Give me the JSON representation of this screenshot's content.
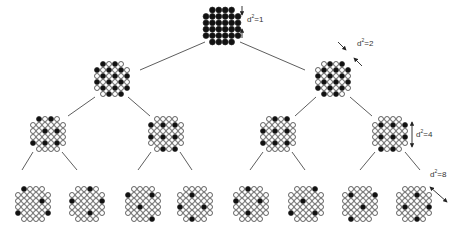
{
  "colors": {
    "filled": "#111111",
    "stroke": "#222222",
    "empty": "#ffffff",
    "line": "#333333"
  },
  "grid_rows": [
    [
      1,
      2,
      3,
      4
    ],
    [
      0,
      1,
      2,
      3,
      4,
      5
    ],
    [
      0,
      1,
      2,
      3,
      4,
      5
    ],
    [
      0,
      1,
      2,
      3,
      4,
      5
    ],
    [
      0,
      1,
      2,
      3,
      4,
      5
    ],
    [
      1,
      2,
      3,
      4
    ]
  ],
  "nodes": [
    {
      "id": "root",
      "cx": 222,
      "cy": 26,
      "pitch": 6.4,
      "r": 2.9,
      "mask": [
        "1111",
        "111111",
        "111111",
        "111111",
        "111111",
        "1111"
      ]
    },
    {
      "id": "L1",
      "cx": 112,
      "cy": 79,
      "pitch": 6.0,
      "r": 2.5,
      "mask": [
        "1010",
        "101010",
        "010101",
        "101010",
        "010101",
        "0101"
      ]
    },
    {
      "id": "R1",
      "cx": 333,
      "cy": 79,
      "pitch": 6.0,
      "r": 2.5,
      "mask": [
        "0101",
        "010101",
        "101010",
        "010101",
        "101010",
        "1010"
      ]
    },
    {
      "id": "LL",
      "cx": 48,
      "cy": 134,
      "pitch": 6.0,
      "r": 2.5,
      "mask": [
        "1010",
        "000000",
        "001010",
        "000000",
        "101010",
        "0000"
      ]
    },
    {
      "id": "LR",
      "cx": 166,
      "cy": 134,
      "pitch": 6.0,
      "r": 2.5,
      "mask": [
        "0000",
        "101010",
        "000000",
        "101010",
        "000000",
        "0101"
      ]
    },
    {
      "id": "RL",
      "cx": 278,
      "cy": 134,
      "pitch": 6.0,
      "r": 2.5,
      "mask": [
        "0101",
        "000000",
        "101010",
        "000000",
        "101010",
        "0000"
      ]
    },
    {
      "id": "RR",
      "cx": 390,
      "cy": 134,
      "pitch": 6.0,
      "r": 2.5,
      "mask": [
        "0000",
        "010101",
        "000000",
        "010101",
        "000000",
        "1010"
      ]
    },
    {
      "id": "LLL",
      "cx": 33,
      "cy": 204,
      "pitch": 6.0,
      "r": 2.5,
      "mask": [
        "1000",
        "000000",
        "000010",
        "000000",
        "100001",
        "0000"
      ]
    },
    {
      "id": "LLR",
      "cx": 87,
      "cy": 204,
      "pitch": 6.0,
      "r": 2.5,
      "mask": [
        "0010",
        "000000",
        "100001",
        "000000",
        "000100",
        "0000"
      ]
    },
    {
      "id": "LRL",
      "cx": 143,
      "cy": 204,
      "pitch": 6.0,
      "r": 2.5,
      "mask": [
        "0000",
        "100010",
        "000000",
        "001000",
        "000000",
        "0001"
      ]
    },
    {
      "id": "LRR",
      "cx": 195,
      "cy": 204,
      "pitch": 6.0,
      "r": 2.5,
      "mask": [
        "0000",
        "001000",
        "000000",
        "100010",
        "000000",
        "0100"
      ]
    },
    {
      "id": "RLL",
      "cx": 251,
      "cy": 204,
      "pitch": 6.0,
      "r": 2.5,
      "mask": [
        "0100",
        "000000",
        "100010",
        "000000",
        "001000",
        "0000"
      ]
    },
    {
      "id": "RLR",
      "cx": 306,
      "cy": 204,
      "pitch": 6.0,
      "r": 2.5,
      "mask": [
        "0001",
        "000000",
        "001000",
        "000000",
        "100010",
        "0000"
      ]
    },
    {
      "id": "RRL",
      "cx": 360,
      "cy": 204,
      "pitch": 6.0,
      "r": 2.5,
      "mask": [
        "0000",
        "010001",
        "000000",
        "000100",
        "000000",
        "1000"
      ]
    },
    {
      "id": "RRR",
      "cx": 414,
      "cy": 204,
      "pitch": 6.0,
      "r": 2.5,
      "mask": [
        "0000",
        "000100",
        "000000",
        "010001",
        "000000",
        "0010"
      ]
    }
  ],
  "edges": [
    {
      "from": [
        205,
        42
      ],
      "to": [
        140,
        70
      ]
    },
    {
      "from": [
        240,
        42
      ],
      "to": [
        305,
        70
      ]
    },
    {
      "from": [
        95,
        97
      ],
      "to": [
        68,
        116
      ]
    },
    {
      "from": [
        128,
        97
      ],
      "to": [
        150,
        116
      ]
    },
    {
      "from": [
        316,
        97
      ],
      "to": [
        295,
        116
      ]
    },
    {
      "from": [
        350,
        97
      ],
      "to": [
        372,
        116
      ]
    },
    {
      "from": [
        33,
        152
      ],
      "to": [
        22,
        170
      ]
    },
    {
      "from": [
        62,
        152
      ],
      "to": [
        77,
        170
      ]
    },
    {
      "from": [
        151,
        152
      ],
      "to": [
        138,
        170
      ]
    },
    {
      "from": [
        180,
        152
      ],
      "to": [
        192,
        170
      ]
    },
    {
      "from": [
        263,
        152
      ],
      "to": [
        250,
        170
      ]
    },
    {
      "from": [
        292,
        152
      ],
      "to": [
        305,
        170
      ]
    },
    {
      "from": [
        375,
        152
      ],
      "to": [
        360,
        170
      ]
    },
    {
      "from": [
        405,
        152
      ],
      "to": [
        420,
        170
      ]
    }
  ],
  "annotations": [
    {
      "id": "d1",
      "text_base": "d",
      "text_exp": "2",
      "text_rest": "=1",
      "x": 247,
      "y": 15,
      "arrow": {
        "type": "vertical-pair",
        "x": 242,
        "y1": 6,
        "y2": 38
      }
    },
    {
      "id": "d2",
      "text_base": "d",
      "text_exp": "2",
      "text_rest": "=2",
      "x": 357,
      "y": 39,
      "arrow": {
        "type": "diag-pair",
        "x1": 342,
        "y1": 46,
        "x2": 358,
        "y2": 62
      }
    },
    {
      "id": "d4",
      "text_base": "d",
      "text_exp": "2",
      "text_rest": "=4",
      "x": 416,
      "y": 130,
      "arrow": {
        "type": "vertical-double",
        "x": 412,
        "y1": 122,
        "y2": 147
      }
    },
    {
      "id": "d8",
      "text_base": "d",
      "text_exp": "2",
      "text_rest": "=8",
      "x": 430,
      "y": 170,
      "arrow": {
        "type": "diag-double",
        "x1": 430,
        "y1": 187,
        "x2": 447,
        "y2": 202
      }
    }
  ]
}
